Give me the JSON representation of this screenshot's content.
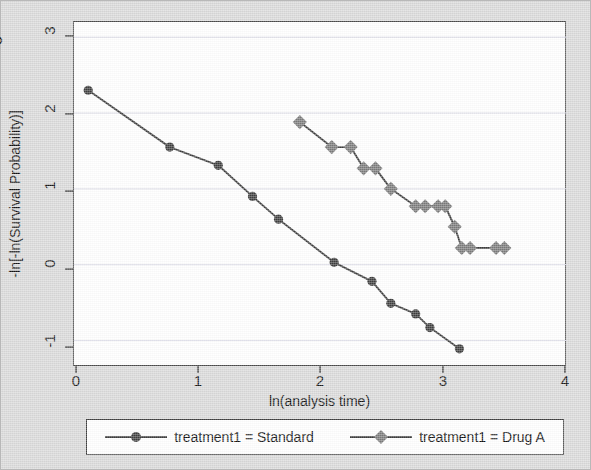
{
  "figure": {
    "background_color": "#d9d9d9",
    "plot_background_color": "#ffffff",
    "frame_color": "#4a4a4a"
  },
  "axes": {
    "x_title": "ln(analysis time)",
    "y_title": "-ln[-ln(Survival Probability)]",
    "x_ticks": [
      "0",
      "1",
      "2",
      "3",
      "4"
    ],
    "y_ticks": [
      "3",
      "2",
      "1",
      "0",
      "-1"
    ]
  },
  "legend": {
    "entries": [
      {
        "label": "treatment1 = Standard",
        "marker": "circle",
        "color": "#3d3d3d"
      },
      {
        "label": "treatment1 = Drug A",
        "marker": "diamond",
        "color": "#7a7a7a"
      }
    ]
  },
  "chart_data": {
    "type": "line",
    "title": "",
    "xlabel": "ln(analysis time)",
    "ylabel": "-ln[-ln(Survival Probability)]",
    "xlim": [
      -0.12,
      4.05
    ],
    "ylim": [
      -1.35,
      3.2
    ],
    "xticks": [
      0,
      1,
      2,
      3,
      4
    ],
    "yticks": [
      -1,
      0,
      1,
      2,
      3
    ],
    "grid": "horizontal",
    "legend_position": "below-axes",
    "series": [
      {
        "name": "treatment1 = Standard",
        "marker": "circle",
        "color": "#3d3d3d",
        "points": [
          [
            0.0,
            2.3
          ],
          [
            0.69,
            1.55
          ],
          [
            1.1,
            1.31
          ],
          [
            1.39,
            0.9
          ],
          [
            1.61,
            0.6
          ],
          [
            2.08,
            0.03
          ],
          [
            2.4,
            -0.22
          ],
          [
            2.56,
            -0.51
          ],
          [
            2.77,
            -0.65
          ],
          [
            2.89,
            -0.83
          ],
          [
            3.14,
            -1.11
          ]
        ]
      },
      {
        "name": "treatment1 = Drug A",
        "marker": "diamond",
        "color": "#7a7a7a",
        "points": [
          [
            1.79,
            1.88
          ],
          [
            2.06,
            1.55
          ],
          [
            2.22,
            1.55
          ],
          [
            2.33,
            1.27
          ],
          [
            2.43,
            1.27
          ],
          [
            2.56,
            1.0
          ],
          [
            2.77,
            0.77
          ],
          [
            2.85,
            0.77
          ],
          [
            2.96,
            0.77
          ],
          [
            3.02,
            0.77
          ],
          [
            3.1,
            0.5
          ],
          [
            3.16,
            0.22
          ],
          [
            3.23,
            0.22
          ],
          [
            3.45,
            0.22
          ],
          [
            3.52,
            0.22
          ]
        ]
      }
    ]
  }
}
